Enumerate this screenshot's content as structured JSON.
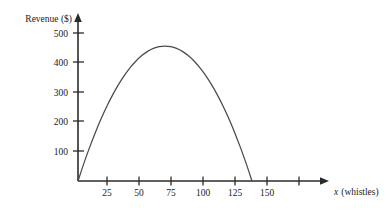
{
  "chart_data": {
    "type": "line",
    "title": "",
    "subtitle": "",
    "xlabel": "x (whistles)",
    "xlabel_var": "x",
    "xlabel_rest": " (whistles)",
    "ylabel": "Revenue ($)",
    "xlim": [
      0,
      175
    ],
    "ylim": [
      0,
      530
    ],
    "grid": false,
    "legend": "none",
    "x_ticks": [
      25,
      50,
      75,
      100,
      125,
      150,
      175
    ],
    "x_tick_labels": [
      "25",
      "50",
      "75",
      "100",
      "125",
      "150",
      ""
    ],
    "y_ticks": [
      100,
      200,
      300,
      400,
      500
    ],
    "y_tick_labels": [
      "100",
      "200",
      "300",
      "400",
      "500"
    ],
    "series": [
      {
        "name": "Revenue",
        "color": "#4a4a4a",
        "equation": "R = 12x - 0.08x^2",
        "vertex": [
          75,
          450
        ],
        "roots": [
          0,
          150
        ],
        "x": [
          0,
          5,
          10,
          15,
          20,
          25,
          30,
          35,
          40,
          45,
          50,
          55,
          60,
          65,
          70,
          75,
          80,
          85,
          90,
          95,
          100,
          105,
          110,
          115,
          120,
          125,
          130,
          135,
          140,
          145,
          150
        ],
        "values": [
          0,
          58,
          112,
          162,
          208,
          250,
          288,
          322,
          352,
          378,
          400,
          418,
          432,
          442,
          448,
          450,
          448,
          442,
          432,
          418,
          400,
          378,
          352,
          322,
          288,
          250,
          208,
          162,
          112,
          58,
          0
        ]
      }
    ],
    "annotations": []
  },
  "axes": {
    "y_axis_title": "Revenue ($)",
    "x_axis_title_var": "x",
    "x_axis_title_rest": "(whistles)"
  },
  "colors": {
    "axis": "#2b2b2b",
    "curve": "#4a4a4a",
    "text": "#1a1a1a",
    "background": "#ffffff"
  }
}
